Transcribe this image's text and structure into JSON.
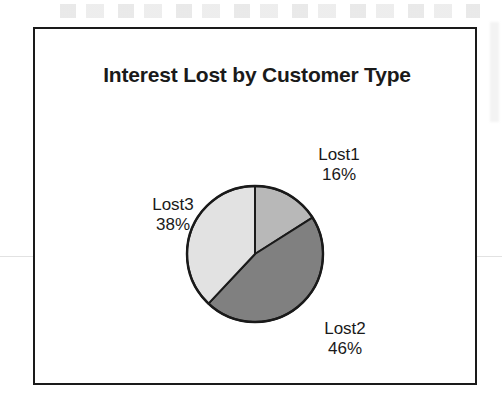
{
  "chart": {
    "title": "Interest Lost by Customer Type",
    "frame_border_color": "#1a1a1a",
    "background_color": "#ffffff"
  },
  "chart_data": {
    "type": "pie",
    "title": "Interest Lost by Customer Type",
    "xlabel": "",
    "ylabel": "",
    "grid": false,
    "legend": "none",
    "labels_position": "outside",
    "start_angle_deg": 0,
    "direction": "clockwise",
    "categories": [
      "Lost1",
      "Lost2",
      "Lost3"
    ],
    "values": [
      16,
      46,
      38
    ],
    "value_unit": "percent",
    "value_labels": [
      "16%",
      "46%",
      "38%"
    ],
    "slice_colors": [
      "#b8b8b8",
      "#808080",
      "#e2e2e2"
    ],
    "slice_outline_color": "#1a1a1a"
  },
  "labels": {
    "lost1": {
      "name": "Lost1",
      "value": "16%"
    },
    "lost2": {
      "name": "Lost2",
      "value": "46%"
    },
    "lost3": {
      "name": "Lost3",
      "value": "38%"
    }
  }
}
